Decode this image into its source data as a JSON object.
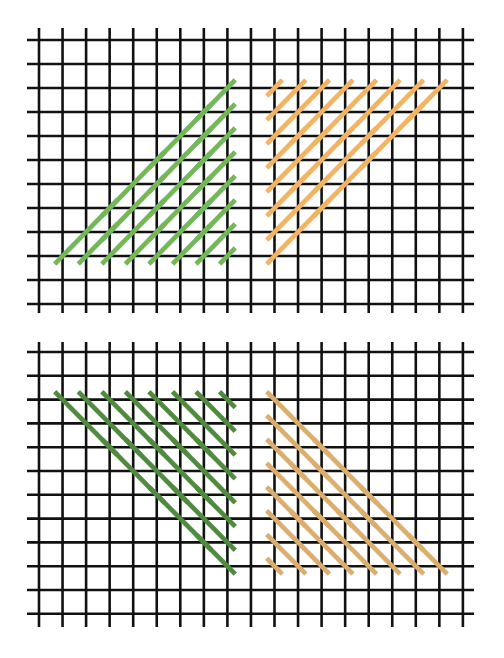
{
  "page": {
    "background": "#ffffff",
    "grid_color": "#111111",
    "grid_line_width": 2.6,
    "stitch_width": 4.2,
    "stitch_overshoot": 0.33
  },
  "diagrams": [
    {
      "name": "top-diagram",
      "grid": {
        "columns": 19,
        "rows": 12,
        "x0": 39,
        "dx": 23.55,
        "y0": 40,
        "dy": 24.0,
        "h_line_x_start": 27,
        "h_line_x_end": 474,
        "v_line_y_start": 28,
        "v_line_y_end": 313
      },
      "blocks": [
        {
          "name": "green-block-top-left",
          "color": "#74b84f",
          "edge_color": "#5aa8a0",
          "direction": "up-right",
          "stitches": [
            [
              1,
              9,
              3,
              7
            ],
            [
              3,
              7,
              5,
              5
            ],
            [
              5,
              5,
              7,
              3
            ],
            [
              7,
              3,
              8,
              2
            ],
            [
              2,
              9,
              3,
              8
            ],
            [
              3,
              8,
              5,
              6
            ],
            [
              5,
              6,
              7,
              4
            ],
            [
              7,
              4,
              8,
              3
            ],
            [
              3,
              9,
              5,
              7
            ],
            [
              5,
              7,
              7,
              5
            ],
            [
              7,
              5,
              8,
              4
            ],
            [
              4,
              9,
              5,
              8
            ],
            [
              5,
              8,
              7,
              6
            ],
            [
              7,
              6,
              8,
              5
            ],
            [
              5,
              9,
              7,
              7
            ],
            [
              7,
              7,
              8,
              6
            ],
            [
              6,
              9,
              7,
              8
            ],
            [
              7,
              8,
              8,
              7
            ],
            [
              7,
              9,
              8,
              8
            ],
            [
              8,
              9,
              8,
              9
            ]
          ]
        },
        {
          "name": "orange-block-top-right",
          "color": "#f2b462",
          "edge_color": "#f2b462",
          "direction": "up-right",
          "stitches": [
            [
              10,
              2,
              10,
              2
            ],
            [
              10,
              3,
              11,
              2
            ],
            [
              10,
              4,
              12,
              2
            ],
            [
              10,
              5,
              11,
              4
            ],
            [
              11,
              4,
              13,
              2
            ],
            [
              10,
              6,
              12,
              4
            ],
            [
              12,
              4,
              14,
              2
            ],
            [
              10,
              7,
              11,
              6
            ],
            [
              11,
              6,
              13,
              4
            ],
            [
              13,
              4,
              15,
              2
            ],
            [
              10,
              8,
              12,
              6
            ],
            [
              12,
              6,
              14,
              4
            ],
            [
              14,
              4,
              16,
              2
            ],
            [
              10,
              9,
              12,
              7
            ],
            [
              12,
              7,
              14,
              5
            ],
            [
              14,
              5,
              16,
              3
            ],
            [
              16,
              3,
              17,
              2
            ]
          ]
        }
      ]
    },
    {
      "name": "bottom-diagram",
      "grid": {
        "columns": 19,
        "rows": 12,
        "x0": 39,
        "dx": 23.55,
        "y0": 22,
        "dy": 23.8,
        "h_line_x_start": 27,
        "h_line_x_end": 474,
        "v_line_y_start": 12,
        "v_line_y_end": 297
      },
      "blocks": [
        {
          "name": "green-block-bottom-left",
          "color": "#4f8a3f",
          "edge_color": "#4f8a3f",
          "direction": "down-right",
          "stitches": [
            [
              1,
              2,
              3,
              4
            ],
            [
              3,
              4,
              5,
              6
            ],
            [
              5,
              6,
              7,
              8
            ],
            [
              7,
              8,
              8,
              9
            ],
            [
              2,
              2,
              4,
              4
            ],
            [
              4,
              4,
              6,
              6
            ],
            [
              6,
              6,
              8,
              8
            ],
            [
              3,
              2,
              5,
              4
            ],
            [
              5,
              4,
              7,
              6
            ],
            [
              7,
              6,
              8,
              7
            ],
            [
              4,
              2,
              6,
              4
            ],
            [
              6,
              4,
              8,
              6
            ],
            [
              5,
              2,
              7,
              4
            ],
            [
              7,
              4,
              8,
              5
            ],
            [
              6,
              2,
              8,
              4
            ],
            [
              7,
              2,
              8,
              3
            ],
            [
              8,
              2,
              8,
              2
            ]
          ]
        },
        {
          "name": "orange-block-bottom-right",
          "color": "#dcae6e",
          "edge_color": "#dcae6e",
          "direction": "down-right",
          "stitches": [
            [
              10,
              2,
              12,
              4
            ],
            [
              12,
              4,
              14,
              6
            ],
            [
              14,
              6,
              16,
              8
            ],
            [
              16,
              8,
              17,
              9
            ],
            [
              10,
              3,
              12,
              5
            ],
            [
              12,
              5,
              14,
              7
            ],
            [
              14,
              7,
              16,
              9
            ],
            [
              10,
              4,
              11,
              5
            ],
            [
              11,
              5,
              13,
              7
            ],
            [
              13,
              7,
              15,
              9
            ],
            [
              10,
              5,
              12,
              7
            ],
            [
              12,
              7,
              14,
              9
            ],
            [
              10,
              6,
              11,
              7
            ],
            [
              11,
              7,
              13,
              9
            ],
            [
              10,
              7,
              12,
              9
            ],
            [
              10,
              8,
              11,
              9
            ],
            [
              10,
              9,
              10,
              9
            ]
          ]
        }
      ]
    }
  ]
}
